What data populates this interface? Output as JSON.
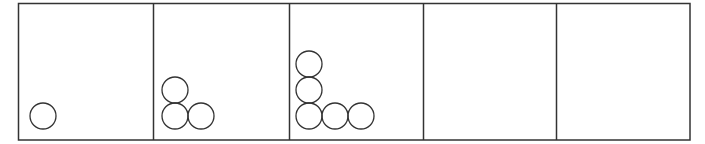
{
  "figure": {
    "stroke_color": "#333333",
    "background": "#ffffff",
    "panels": [
      {
        "index": 1,
        "circle_count": 1,
        "circles": [
          [
            43,
            116
          ]
        ]
      },
      {
        "index": 2,
        "circle_count": 3,
        "circles": [
          [
            175,
            90
          ],
          [
            175,
            116
          ],
          [
            201,
            116
          ]
        ]
      },
      {
        "index": 3,
        "circle_count": 5,
        "circles": [
          [
            309,
            64
          ],
          [
            309,
            90
          ],
          [
            309,
            116
          ],
          [
            335,
            116
          ],
          [
            361,
            116
          ]
        ]
      },
      {
        "index": 4,
        "circle_count": 0,
        "circles": []
      },
      {
        "index": 5,
        "circle_count": 0,
        "circles": []
      }
    ],
    "circle_radius": 13
  }
}
